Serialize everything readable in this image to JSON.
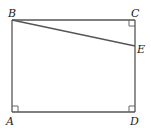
{
  "diagram": {
    "type": "geometry",
    "shape": "rectangle ABCD with segment BE",
    "points": {
      "A": {
        "label": "A",
        "x": 12,
        "y": 112
      },
      "B": {
        "label": "B",
        "x": 12,
        "y": 20
      },
      "C": {
        "label": "C",
        "x": 135,
        "y": 20
      },
      "D": {
        "label": "D",
        "x": 135,
        "y": 112
      },
      "E": {
        "label": "E",
        "x": 135,
        "y": 46
      }
    },
    "segments": [
      "AB",
      "BC",
      "CD",
      "DA",
      "BE"
    ],
    "right_angles": [
      "A",
      "C",
      "D"
    ],
    "colors": {
      "line": "#555555",
      "label": "#222222",
      "background": "#ffffff"
    }
  }
}
